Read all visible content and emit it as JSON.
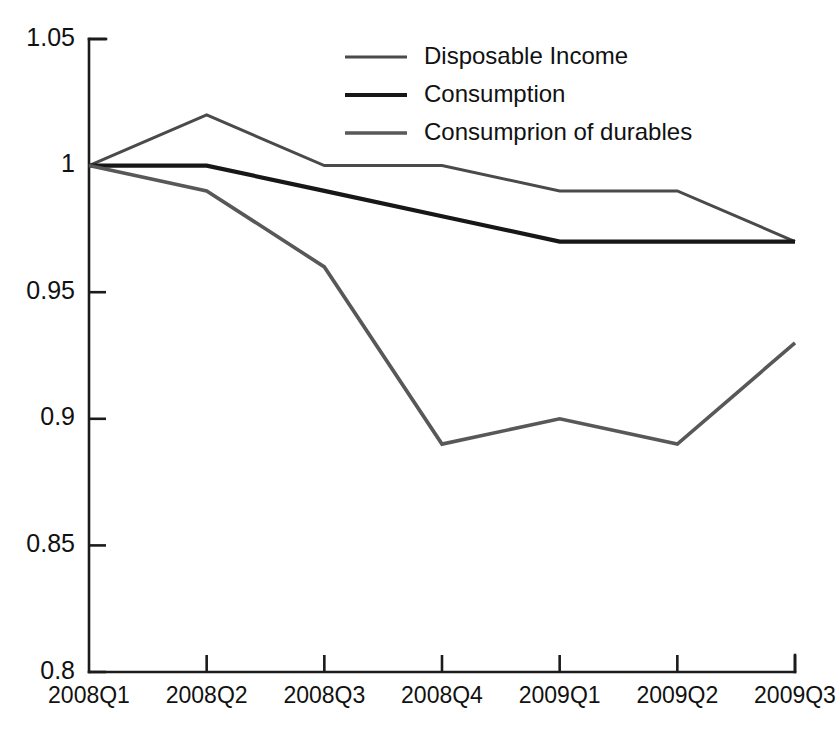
{
  "chart_data": {
    "type": "line",
    "title": "",
    "subtitle": "",
    "xlabel": "",
    "ylabel": "",
    "categories": [
      "2008Q1",
      "2008Q2",
      "2008Q3",
      "2008Q4",
      "2009Q1",
      "2009Q2",
      "2009Q3"
    ],
    "ylim": [
      0.8,
      1.05
    ],
    "yticks": [
      "0.8",
      "0.85",
      "0.9",
      "0.95",
      "1",
      "1.05"
    ],
    "ytick_values": [
      0.8,
      0.85,
      0.9,
      0.95,
      1.0,
      1.05
    ],
    "grid": false,
    "legend_position": "top-right",
    "series": [
      {
        "name": "Disposable Income",
        "color": "#4a4a4a",
        "width": 3.0,
        "values": [
          1.0,
          1.02,
          1.0,
          1.0,
          0.99,
          0.99,
          0.97
        ]
      },
      {
        "name": "Consumption",
        "color": "#171717",
        "width": 4.2,
        "values": [
          1.0,
          1.0,
          0.99,
          0.98,
          0.97,
          0.97,
          0.97
        ]
      },
      {
        "name": "Consumprion of durables",
        "color": "#585858",
        "width": 3.6,
        "values": [
          1.0,
          0.99,
          0.96,
          0.89,
          0.9,
          0.89,
          0.93
        ]
      }
    ]
  },
  "axes": {
    "y_axis_name": "value-axis",
    "x_axis_name": "quarter-axis"
  },
  "legend": {
    "entries": [
      {
        "label": "Disposable Income"
      },
      {
        "label": "Consumption"
      },
      {
        "label": "Consumprion of durables"
      }
    ]
  },
  "colors": {
    "axis": "#1b1b1b",
    "background": "#ffffff",
    "text": "#111111"
  }
}
